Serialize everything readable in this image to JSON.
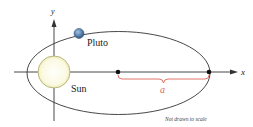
{
  "diagram": {
    "type": "orbit-ellipse",
    "axes": {
      "x_label": "x",
      "y_label": "y"
    },
    "bodies": {
      "sun": {
        "label": "Sun",
        "fill": "#fdfbe3",
        "stroke": "#b9b77a"
      },
      "pluto": {
        "label": "Pluto",
        "fill": "#5b86b3",
        "stroke": "#3b5c80"
      }
    },
    "semi_major_axis": {
      "label": "a",
      "color": "#e0655a"
    },
    "note": "Not drawn to scale",
    "colors": {
      "line": "#333333",
      "point": "#111111"
    }
  }
}
